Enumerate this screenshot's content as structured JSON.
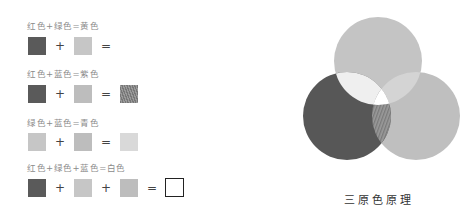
{
  "rows": [
    {
      "label": "红色+绿色=黄色",
      "operands": [
        "red",
        "green"
      ],
      "operators": [
        "+",
        "="
      ],
      "result": "yellow"
    },
    {
      "label": "红色+蓝色=紫色",
      "operands": [
        "red",
        "blue"
      ],
      "operators": [
        "+",
        "="
      ],
      "result": "purple"
    },
    {
      "label": "绿色+蓝色=青色",
      "operands": [
        "green",
        "blue"
      ],
      "operators": [
        "+",
        "="
      ],
      "result": "cyan"
    },
    {
      "label": "红色+绿色+蓝色=白色",
      "operands": [
        "red",
        "green",
        "blue"
      ],
      "operators": [
        "+",
        "+",
        "="
      ],
      "result": "white"
    }
  ],
  "diagram": {
    "caption": "三原色原理",
    "circles": [
      {
        "name": "green",
        "color": "#c4c4c4"
      },
      {
        "name": "red",
        "color": "#575757"
      },
      {
        "name": "blue",
        "color": "#c0c0c0"
      }
    ]
  },
  "colors": {
    "red_swatch": "#5a5a5a",
    "green_swatch": "#c6c6c6",
    "blue_swatch": "#bdbdbd",
    "cyan_swatch": "#d9d9d9",
    "white_swatch": "#ffffff"
  }
}
